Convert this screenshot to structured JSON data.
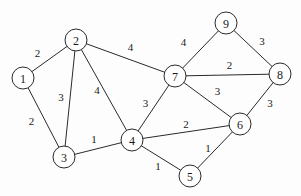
{
  "nodes": [
    {
      "id": "1",
      "label": "1"
    },
    {
      "id": "2",
      "label": "2"
    },
    {
      "id": "3",
      "label": "3"
    },
    {
      "id": "4",
      "label": "4"
    },
    {
      "id": "5",
      "label": "5"
    },
    {
      "id": "6",
      "label": "6"
    },
    {
      "id": "7",
      "label": "7"
    },
    {
      "id": "8",
      "label": "8"
    },
    {
      "id": "9",
      "label": "9"
    }
  ],
  "edges": [
    {
      "from": "1",
      "to": "2",
      "weight": "2"
    },
    {
      "from": "1",
      "to": "3",
      "weight": "2"
    },
    {
      "from": "2",
      "to": "3",
      "weight": "3"
    },
    {
      "from": "2",
      "to": "4",
      "weight": "4"
    },
    {
      "from": "2",
      "to": "7",
      "weight": "4"
    },
    {
      "from": "3",
      "to": "4",
      "weight": "1"
    },
    {
      "from": "4",
      "to": "7",
      "weight": "3"
    },
    {
      "from": "4",
      "to": "6",
      "weight": "2"
    },
    {
      "from": "4",
      "to": "5",
      "weight": "1"
    },
    {
      "from": "5",
      "to": "6",
      "weight": "1"
    },
    {
      "from": "7",
      "to": "6",
      "weight": "3"
    },
    {
      "from": "7",
      "to": "9",
      "weight": "4"
    },
    {
      "from": "7",
      "to": "8",
      "weight": "2"
    },
    {
      "from": "9",
      "to": "8",
      "weight": "3"
    },
    {
      "from": "8",
      "to": "6",
      "weight": "3"
    }
  ]
}
